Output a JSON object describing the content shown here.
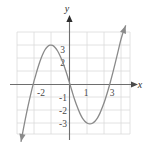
{
  "figure": {
    "kind": "cartesian-graph",
    "background_color": "#ffffff",
    "grid_color": "#d9d9d9",
    "axis_color": "#6e6e6e",
    "curve_color": "#7a7a7a",
    "label_color": "#4a4a4a"
  },
  "axes": {
    "x_name": "x",
    "y_name": "y",
    "x_tick_labels": [
      "-2",
      "1",
      "3"
    ],
    "y_tick_labels": [
      "3",
      "2",
      "-1",
      "-2",
      "-3"
    ],
    "x_range": [
      -3.4,
      4.0
    ],
    "y_range": [
      -3.3,
      3.3
    ],
    "grid": "on"
  },
  "chart_data": {
    "type": "line",
    "title": "",
    "xlabel": "x",
    "ylabel": "y",
    "xlim": [
      -3.4,
      4.0
    ],
    "ylim": [
      -3.3,
      3.3
    ],
    "grid": true,
    "legend": "none",
    "series": [
      {
        "name": "cubic curve",
        "x": [
          -2.85,
          -2.7,
          -2.5,
          -2.3,
          -2.1,
          -2.0,
          -1.9,
          -1.75,
          -1.6,
          -1.45,
          -1.3,
          -1.15,
          -1.0,
          -0.85,
          -0.7,
          -0.55,
          -0.4,
          -0.25,
          -0.1,
          0.0,
          0.15,
          0.3,
          0.45,
          0.6,
          0.75,
          0.9,
          1.05,
          1.2,
          1.35,
          1.5,
          1.65,
          1.8,
          1.95,
          2.1,
          2.25,
          2.4,
          2.55,
          2.7,
          2.85,
          3.0,
          3.1,
          3.2,
          3.3
        ],
        "y": [
          -3.35,
          -2.55,
          -1.55,
          -0.65,
          0.15,
          0.5,
          0.85,
          1.32,
          1.72,
          2.03,
          2.22,
          2.31,
          2.3,
          2.18,
          1.97,
          1.68,
          1.32,
          0.9,
          0.43,
          0.1,
          -0.4,
          -0.88,
          -1.3,
          -1.67,
          -1.96,
          -2.16,
          -2.28,
          -2.32,
          -2.28,
          -2.16,
          -1.96,
          -1.67,
          -1.3,
          -0.88,
          -0.4,
          0.13,
          0.7,
          1.3,
          1.92,
          2.55,
          2.9,
          3.2,
          3.45
        ],
        "local_maximum": [
          -1.13,
          2.31
        ],
        "local_minimum": [
          1.21,
          -2.32
        ],
        "arrow_start": "down-left",
        "arrow_end": "up-right"
      }
    ]
  }
}
